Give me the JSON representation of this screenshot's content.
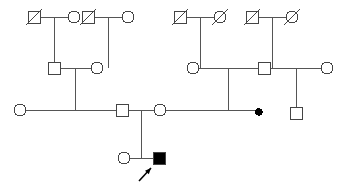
{
  "diagram": {
    "type": "pedigree",
    "background_color": "#ffffff",
    "line_color": "#555555",
    "symbol_stroke_color": "#444444",
    "affected_fill_color": "#000000",
    "unaffected_fill_color": "#ffffff",
    "stroke_width": 1
  },
  "legend_semantics": {
    "square": "male",
    "circle": "female",
    "slash": "deceased",
    "filled": "affected",
    "small-filled-dot": "miscarriage / pregnancy loss",
    "arrow": "proband"
  },
  "generations": [
    {
      "id": "I",
      "label": "I",
      "y": 17,
      "individuals": [
        {
          "id": "I-1",
          "name": "deceased-male",
          "shape": "square",
          "sex": "male",
          "deceased": true,
          "affected": false,
          "x": 34,
          "y": 17
        },
        {
          "id": "I-2",
          "name": "female",
          "shape": "circle",
          "sex": "female",
          "deceased": false,
          "affected": false,
          "x": 74,
          "y": 17
        },
        {
          "id": "I-3",
          "name": "deceased-male",
          "shape": "square",
          "sex": "male",
          "deceased": true,
          "affected": false,
          "x": 88,
          "y": 17
        },
        {
          "id": "I-4",
          "name": "female",
          "shape": "circle",
          "sex": "female",
          "deceased": false,
          "affected": false,
          "x": 128,
          "y": 17
        },
        {
          "id": "I-5",
          "name": "deceased-male",
          "shape": "square",
          "sex": "male",
          "deceased": true,
          "affected": false,
          "x": 180,
          "y": 17
        },
        {
          "id": "I-6",
          "name": "deceased-female",
          "shape": "circle",
          "sex": "female",
          "deceased": true,
          "affected": false,
          "x": 220,
          "y": 17
        },
        {
          "id": "I-7",
          "name": "deceased-male",
          "shape": "square",
          "sex": "male",
          "deceased": true,
          "affected": false,
          "x": 252,
          "y": 17
        },
        {
          "id": "I-8",
          "name": "deceased-female",
          "shape": "circle",
          "sex": "female",
          "deceased": true,
          "affected": false,
          "x": 292,
          "y": 17
        }
      ],
      "unions": [
        {
          "id": "U-I-1",
          "partners": [
            "I-1",
            "I-2"
          ],
          "mid_x": 54,
          "y": 17,
          "child_drop_x": 54
        },
        {
          "id": "U-I-2",
          "partners": [
            "I-3",
            "I-4"
          ],
          "mid_x": 108,
          "y": 17,
          "child_drop_x": 108
        },
        {
          "id": "U-I-3",
          "partners": [
            "I-5",
            "I-6"
          ],
          "mid_x": 200,
          "y": 17,
          "child_drop_x": 200
        },
        {
          "id": "U-I-4",
          "partners": [
            "I-7",
            "I-8"
          ],
          "mid_x": 272,
          "y": 17,
          "child_drop_x": 272
        }
      ]
    },
    {
      "id": "II",
      "label": "II",
      "y": 68,
      "individuals": [
        {
          "id": "II-1",
          "name": "male",
          "shape": "square",
          "sex": "male",
          "deceased": false,
          "affected": false,
          "x": 54,
          "y": 68
        },
        {
          "id": "II-2",
          "name": "female",
          "shape": "circle",
          "sex": "female",
          "deceased": false,
          "affected": false,
          "x": 97,
          "y": 68
        },
        {
          "id": "II-3",
          "name": "female",
          "shape": "circle",
          "sex": "female",
          "deceased": false,
          "affected": false,
          "x": 193,
          "y": 68
        },
        {
          "id": "II-4",
          "name": "male",
          "shape": "square",
          "sex": "male",
          "deceased": false,
          "affected": false,
          "x": 264,
          "y": 68
        },
        {
          "id": "II-5",
          "name": "female",
          "shape": "circle",
          "sex": "female",
          "deceased": false,
          "affected": false,
          "x": 327,
          "y": 68
        }
      ],
      "unions": [
        {
          "id": "U-II-1",
          "partners": [
            "II-1",
            "II-2"
          ],
          "mid_x": 75,
          "y": 68,
          "child_drop_x": 75
        },
        {
          "id": "U-II-2",
          "partners": [
            "II-3",
            "II-4"
          ],
          "mid_x": 228,
          "y": 68,
          "child_drop_x": 228
        },
        {
          "id": "U-II-3",
          "partners": [
            "II-4",
            "II-5"
          ],
          "mid_x": 296,
          "y": 68,
          "child_drop_x": 296
        }
      ]
    },
    {
      "id": "III",
      "label": "III",
      "y": 110,
      "individuals": [
        {
          "id": "III-1",
          "name": "female",
          "shape": "circle",
          "sex": "female",
          "deceased": false,
          "affected": false,
          "x": 20,
          "y": 110
        },
        {
          "id": "III-2",
          "name": "male",
          "shape": "square",
          "sex": "male",
          "deceased": false,
          "affected": false,
          "x": 122,
          "y": 110
        },
        {
          "id": "III-3",
          "name": "female",
          "shape": "circle",
          "sex": "female",
          "deceased": false,
          "affected": false,
          "x": 160,
          "y": 110
        },
        {
          "id": "III-4",
          "name": "miscarriage",
          "shape": "dot",
          "sex": "unknown",
          "deceased": false,
          "affected": true,
          "x": 259,
          "y": 112
        },
        {
          "id": "III-5",
          "name": "male",
          "shape": "square",
          "sex": "male",
          "deceased": false,
          "affected": false,
          "x": 296,
          "y": 113
        }
      ],
      "unions": [
        {
          "id": "U-III-1",
          "partners": [
            "III-2",
            "III-3"
          ],
          "mid_x": 141,
          "y": 110,
          "child_drop_x": 141
        }
      ]
    },
    {
      "id": "IV",
      "label": "IV",
      "y": 158,
      "individuals": [
        {
          "id": "IV-1",
          "name": "female",
          "shape": "circle",
          "sex": "female",
          "deceased": false,
          "affected": false,
          "x": 124,
          "y": 158
        },
        {
          "id": "IV-2",
          "name": "affected-male-proband",
          "shape": "square",
          "sex": "male",
          "deceased": false,
          "affected": true,
          "proband": true,
          "x": 159,
          "y": 158
        }
      ],
      "unions": []
    }
  ],
  "sibships": [
    {
      "id": "S-1",
      "name": "sibship-I1-I2",
      "parent_union": "U-I-1",
      "bar_y": 68,
      "from_x": 54,
      "to_x": 54,
      "children": [
        "II-1"
      ]
    },
    {
      "id": "S-2",
      "name": "sibship-I3-I4",
      "parent_union": "U-I-2",
      "bar_y": 68,
      "from_x": 108,
      "to_x": 108,
      "children": [
        "II-2"
      ]
    },
    {
      "id": "S-3",
      "name": "sibship-I5-I6",
      "parent_union": "U-I-3",
      "bar_y": 68,
      "from_x": 200,
      "to_x": 200,
      "children": [
        "II-3"
      ]
    },
    {
      "id": "S-4",
      "name": "sibship-I7-I8",
      "parent_union": "U-I-4",
      "bar_y": 68,
      "from_x": 272,
      "to_x": 272,
      "children": [
        "II-4"
      ]
    },
    {
      "id": "S-5",
      "name": "sibship-II1-II2",
      "parent_union": "U-II-1",
      "bar_y": 110,
      "from_x": 20,
      "to_x": 122,
      "children": [
        "III-1",
        "III-2"
      ]
    },
    {
      "id": "S-6",
      "name": "sibship-II3-II4",
      "parent_union": "U-II-2",
      "bar_y": 110,
      "from_x": 160,
      "to_x": 259,
      "children": [
        "III-3",
        "III-4"
      ]
    },
    {
      "id": "S-7",
      "name": "sibship-II4-II5",
      "parent_union": "U-II-3",
      "bar_y": 110,
      "from_x": 296,
      "to_x": 296,
      "children": [
        "III-5"
      ]
    },
    {
      "id": "S-8",
      "name": "sibship-III2-III3",
      "parent_union": "U-III-1",
      "bar_y": 158,
      "from_x": 124,
      "to_x": 159,
      "children": [
        "IV-1",
        "IV-2"
      ]
    }
  ],
  "proband_marker": {
    "name": "proband-arrow",
    "target": "IV-2",
    "tail_x": 139,
    "tail_y": 181,
    "head_x": 151,
    "head_y": 168
  },
  "symbol_size": {
    "square_side": 12,
    "circle_radius": 6,
    "dot_radius": 3.2
  }
}
